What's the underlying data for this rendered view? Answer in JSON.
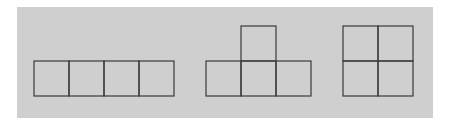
{
  "diagram": {
    "colors": {
      "background": "#ffffff",
      "panel": "#cfcfcf",
      "stroke": "#3a3a3a"
    },
    "unit_size": 35,
    "shapes": [
      {
        "name": "I-tetromino",
        "label": "1x4 row",
        "cells": [
          [
            0,
            0
          ],
          [
            1,
            0
          ],
          [
            2,
            0
          ],
          [
            3,
            0
          ]
        ],
        "origin": [
          34,
          61
        ]
      },
      {
        "name": "T-tetromino",
        "label": "T shape",
        "cells": [
          [
            1,
            0
          ],
          [
            0,
            1
          ],
          [
            1,
            1
          ],
          [
            2,
            1
          ]
        ],
        "origin": [
          206,
          26
        ]
      },
      {
        "name": "O-tetromino",
        "label": "2x2 square",
        "cells": [
          [
            0,
            0
          ],
          [
            1,
            0
          ],
          [
            0,
            1
          ],
          [
            1,
            1
          ]
        ],
        "origin": [
          343,
          26
        ]
      }
    ]
  }
}
